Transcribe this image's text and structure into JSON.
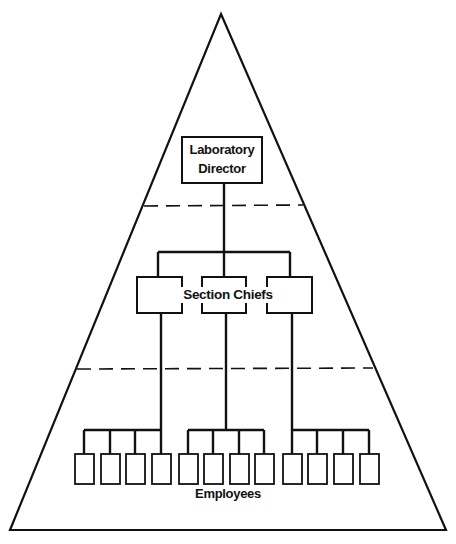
{
  "diagram": {
    "type": "organizational-pyramid",
    "colors": {
      "line": "#111111",
      "background": "#ffffff"
    },
    "levels": [
      {
        "id": "director",
        "label_line1": "Laboratory",
        "label_line2": "Director",
        "box_count": 1
      },
      {
        "id": "section-chiefs",
        "label": "Section Chiefs",
        "box_count": 3
      },
      {
        "id": "employees",
        "label": "Employees",
        "box_count": 12,
        "groups": 3,
        "per_group": 4
      }
    ],
    "separators": 2
  }
}
